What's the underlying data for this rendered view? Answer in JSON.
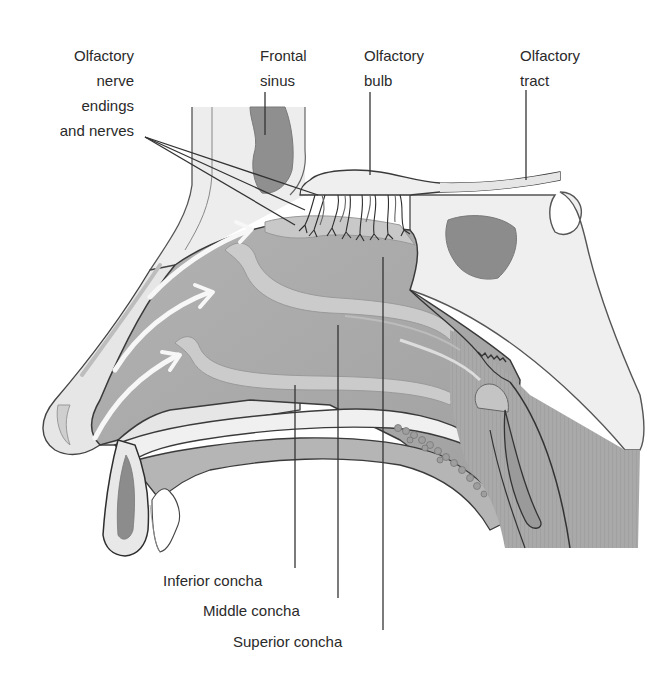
{
  "figure": {
    "type": "anatomical-diagram",
    "colors": {
      "background": "#ffffff",
      "bone_light": "#ececec",
      "tissue_mid": "#b9b9b9",
      "tissue_dark": "#8e8e8e",
      "cavity": "#a8a8a8",
      "outline": "#3a3a3a",
      "airflow_arrow": "#f6f6f6",
      "label_text": "#2a2a2a",
      "leader_line": "#333333"
    }
  },
  "labels": {
    "olfactory_nerve_endings": "Olfactory\nnerve\nendings\nand nerves",
    "frontal_sinus": "Frontal\nsinus",
    "olfactory_bulb": "Olfactory\nbulb",
    "olfactory_tract": "Olfactory\ntract",
    "inferior_concha": "Inferior concha",
    "middle_concha": "Middle concha",
    "superior_concha": "Superior concha"
  },
  "annotations": {
    "airflow_arrows": 3,
    "leader_lines": 9
  }
}
